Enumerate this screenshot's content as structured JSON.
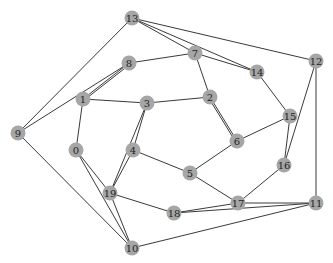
{
  "graph": {
    "node_color": "#a6a6a6",
    "edge_color": "#3a3a3a",
    "background": "#ffffff",
    "nodes": [
      {
        "id": "0",
        "x": 76,
        "y": 150
      },
      {
        "id": "1",
        "x": 83,
        "y": 99
      },
      {
        "id": "2",
        "x": 210,
        "y": 97
      },
      {
        "id": "3",
        "x": 147,
        "y": 103
      },
      {
        "id": "4",
        "x": 133,
        "y": 150
      },
      {
        "id": "5",
        "x": 190,
        "y": 173
      },
      {
        "id": "6",
        "x": 237,
        "y": 141
      },
      {
        "id": "7",
        "x": 195,
        "y": 53
      },
      {
        "id": "8",
        "x": 129,
        "y": 63
      },
      {
        "id": "9",
        "x": 18,
        "y": 133
      },
      {
        "id": "10",
        "x": 132,
        "y": 248
      },
      {
        "id": "11",
        "x": 316,
        "y": 203
      },
      {
        "id": "12",
        "x": 316,
        "y": 61
      },
      {
        "id": "13",
        "x": 132,
        "y": 18
      },
      {
        "id": "14",
        "x": 257,
        "y": 72
      },
      {
        "id": "15",
        "x": 290,
        "y": 116
      },
      {
        "id": "16",
        "x": 284,
        "y": 165
      },
      {
        "id": "17",
        "x": 238,
        "y": 203
      },
      {
        "id": "18",
        "x": 174,
        "y": 213
      },
      {
        "id": "19",
        "x": 110,
        "y": 193
      }
    ],
    "edges": [
      [
        "13",
        "9"
      ],
      [
        "13",
        "14"
      ],
      [
        "13",
        "12"
      ],
      [
        "13",
        "7"
      ],
      [
        "8",
        "7"
      ],
      [
        "8",
        "9"
      ],
      [
        "8",
        "1"
      ],
      [
        "7",
        "14"
      ],
      [
        "7",
        "2"
      ],
      [
        "1",
        "3"
      ],
      [
        "1",
        "0"
      ],
      [
        "1",
        "8"
      ],
      [
        "3",
        "2"
      ],
      [
        "3",
        "4"
      ],
      [
        "3",
        "19"
      ],
      [
        "2",
        "6"
      ],
      [
        "2",
        "6"
      ],
      [
        "4",
        "5"
      ],
      [
        "4",
        "19"
      ],
      [
        "5",
        "6"
      ],
      [
        "5",
        "17"
      ],
      [
        "6",
        "15"
      ],
      [
        "14",
        "15"
      ],
      [
        "15",
        "16"
      ],
      [
        "12",
        "16"
      ],
      [
        "12",
        "11"
      ],
      [
        "16",
        "17"
      ],
      [
        "17",
        "18"
      ],
      [
        "17",
        "11"
      ],
      [
        "18",
        "11"
      ],
      [
        "18",
        "19"
      ],
      [
        "0",
        "19"
      ],
      [
        "0",
        "10"
      ],
      [
        "19",
        "10"
      ],
      [
        "9",
        "10"
      ],
      [
        "11",
        "10"
      ]
    ]
  }
}
